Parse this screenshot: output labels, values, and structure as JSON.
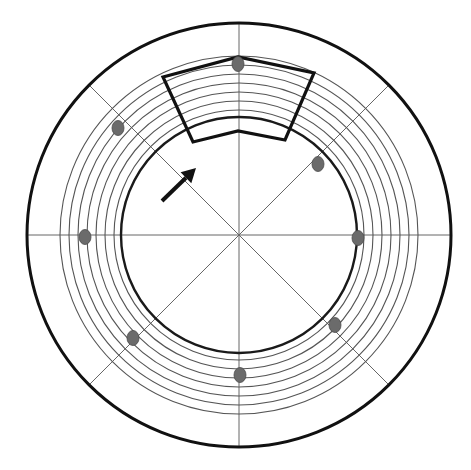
{
  "diagram": {
    "type": "concentric-ring-schematic",
    "canvas": {
      "width": 471,
      "height": 470,
      "background": "#ffffff"
    },
    "center": {
      "x": 239,
      "y": 235
    },
    "outer_circle": {
      "r": 212,
      "stroke": "#111111",
      "width": 3
    },
    "inner_thick_ring": {
      "r": 118,
      "stroke": "#1a1a1a",
      "width": 2.4
    },
    "inner_thin_ring": {
      "r": 125,
      "stroke": "#555555",
      "width": 1.1
    },
    "rings": {
      "radii": [
        134,
        143,
        152,
        161,
        170,
        179
      ],
      "stroke": "#555555",
      "width": 1.1
    },
    "axis_lines": {
      "stroke": "#666666",
      "width": 1,
      "angles_deg": [
        0,
        45,
        90,
        135
      ]
    },
    "dots": {
      "fill": "#6b6b6b",
      "stroke": "#4a4a4a",
      "rx": 6,
      "ry": 7.5,
      "items": [
        {
          "name": "dot-top",
          "x": 238,
          "y": 64
        },
        {
          "name": "dot-upper-right",
          "x": 318,
          "y": 164
        },
        {
          "name": "dot-right",
          "x": 358,
          "y": 238
        },
        {
          "name": "dot-lower-right",
          "x": 335,
          "y": 325
        },
        {
          "name": "dot-bottom",
          "x": 240,
          "y": 375
        },
        {
          "name": "dot-lower-left",
          "x": 133,
          "y": 338
        },
        {
          "name": "dot-left",
          "x": 85,
          "y": 237
        },
        {
          "name": "dot-upper-left",
          "x": 118,
          "y": 128
        }
      ]
    },
    "highlight_sector": {
      "stroke": "#111111",
      "width": 3.2,
      "points": [
        [
          163,
          77
        ],
        [
          238,
          57
        ],
        [
          314,
          73
        ],
        [
          285,
          140
        ],
        [
          238,
          131
        ],
        [
          193,
          142
        ]
      ]
    },
    "arrow": {
      "stroke": "#111111",
      "width": 4,
      "tail": {
        "x": 162,
        "y": 201
      },
      "tip": {
        "x": 196,
        "y": 168
      },
      "head_size": 14
    }
  }
}
